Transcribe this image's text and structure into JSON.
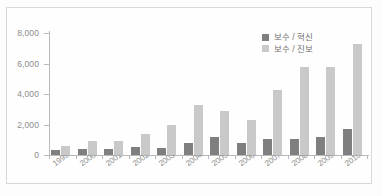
{
  "chart_data": {
    "type": "bar",
    "title": "",
    "subtitle": "",
    "xlabel": "",
    "ylabel": "",
    "ylim": [
      0,
      8000
    ],
    "grid": false,
    "legend_position": "top-right",
    "categories": [
      "1999",
      "2000",
      "2001",
      "2002",
      "2003",
      "2004",
      "2005",
      "2006",
      "2007",
      "2008",
      "2009",
      "2010"
    ],
    "ytick_labels": [
      "0",
      "2,000",
      "4,000",
      "6,000",
      "8,000"
    ],
    "ytick_values": [
      0,
      2000,
      4000,
      6000,
      8000
    ],
    "series": [
      {
        "name": "보수 / 혁신",
        "color": "#7f7f7f",
        "values": [
          350,
          380,
          380,
          500,
          480,
          780,
          1150,
          780,
          1020,
          1080,
          1150,
          1720
        ]
      },
      {
        "name": "보수 / 진보",
        "color": "#c9c9c9",
        "values": [
          600,
          950,
          950,
          1380,
          1950,
          3280,
          2900,
          2320,
          4270,
          5750,
          5750,
          7300
        ]
      }
    ]
  },
  "legend": {
    "items": [
      {
        "label": "보수 / 혁신",
        "swatch": "dark-gray-swatch"
      },
      {
        "label": "보수 / 진보",
        "swatch": "light-gray-swatch"
      }
    ]
  },
  "colors": {
    "series_dark": "#7f7f7f",
    "series_light": "#c9c9c9",
    "axis": "#b9b9b9",
    "tick_text": "#8d8d8d",
    "frame": "#d8d8d8",
    "background": "#fefefe"
  }
}
